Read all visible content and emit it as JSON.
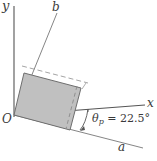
{
  "figure": {
    "colors": {
      "shape_fill": "#c0c0c0",
      "shape_stroke": "#6e6e6e",
      "axis_stroke": "#4a4a4a",
      "dashed_stroke": "#909090",
      "text": "#3a3a3a",
      "background": "#ffffff"
    },
    "labels": {
      "y_axis": "y",
      "x_axis": "x",
      "b_axis": "b",
      "a_axis": "a",
      "origin": "O"
    },
    "angle": {
      "symbol": "θ",
      "subscript": "p",
      "equals": "=",
      "value": "22.5°",
      "full_text": "θp = 22.5°",
      "degrees": 22.5
    },
    "geometry": {
      "origin_px": [
        14,
        115
      ],
      "y_axis_end_px": [
        14,
        6
      ],
      "x_axis_end_px": [
        145,
        105
      ],
      "a_axis_end_px": [
        143,
        149
      ],
      "b_axis_end_px": [
        57,
        12
      ],
      "rectangle_corners_px": [
        [
          14,
          115
        ],
        [
          24,
          73
        ],
        [
          81,
          88
        ],
        [
          70,
          130
        ]
      ],
      "dashed_line_px": [
        [
          22,
          67
        ],
        [
          86,
          84
        ]
      ],
      "dashed_inner_px": [
        [
          78,
          86
        ],
        [
          67,
          128
        ]
      ]
    }
  }
}
